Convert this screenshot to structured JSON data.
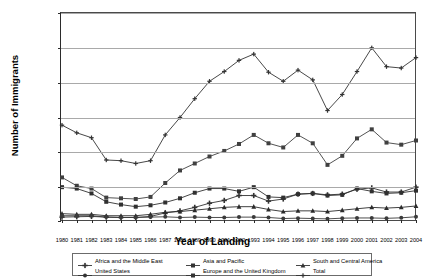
{
  "chart_data": {
    "type": "line",
    "title": "",
    "xlabel": "Year of Landing",
    "ylabel": "Number of Immigrants",
    "ylim": [
      0,
      300000
    ],
    "ytick_labels": [
      "300,000",
      "250,000",
      "200,000",
      "150,000",
      "100,000",
      "50,000",
      "0"
    ],
    "ytick_values": [
      300000,
      250000,
      200000,
      150000,
      100000,
      50000,
      0
    ],
    "grid": true,
    "legend_position": "bottom",
    "categories": [
      "1980",
      "1981",
      "1982",
      "1983",
      "1984",
      "1985",
      "1986",
      "1987",
      "1988",
      "1989",
      "1990",
      "1991",
      "1992",
      "1993",
      "1994",
      "1995",
      "1996",
      "1997",
      "1998",
      "1999",
      "2000",
      "2001",
      "2002",
      "2003",
      "2004"
    ],
    "series": [
      {
        "name": "Africa and the Middle East",
        "marker": "plus-cross",
        "color": "#333333",
        "values": [
          7000,
          7500,
          8000,
          7000,
          6500,
          6500,
          8000,
          13000,
          16000,
          21000,
          27000,
          31000,
          38000,
          38000,
          30000,
          33000,
          40000,
          41000,
          39000,
          40000,
          47000,
          49000,
          43000,
          43000,
          50000
        ]
      },
      {
        "name": "Asia and Pacific",
        "marker": "square",
        "color": "#404040",
        "values": [
          64000,
          52000,
          48000,
          35000,
          34000,
          33000,
          36000,
          56000,
          74000,
          84000,
          94000,
          102000,
          112000,
          125000,
          113000,
          107000,
          125000,
          113000,
          82000,
          95000,
          120000,
          133000,
          114000,
          111000,
          117000
        ]
      },
      {
        "name": "South and Central America",
        "marker": "triangle",
        "color": "#2b2b2b",
        "values": [
          12000,
          11000,
          11000,
          9000,
          9000,
          9000,
          11000,
          14000,
          15000,
          17000,
          19000,
          21000,
          22000,
          22000,
          18000,
          15000,
          16000,
          16000,
          15000,
          17000,
          19000,
          21000,
          20000,
          21000,
          23000
        ]
      },
      {
        "name": "United States",
        "marker": "circle",
        "color": "#3a3a3a",
        "values": [
          9000,
          9000,
          9000,
          7000,
          6500,
          6500,
          7000,
          7500,
          6500,
          7000,
          6500,
          6500,
          7000,
          7000,
          6500,
          5000,
          5500,
          5000,
          4500,
          5500,
          5800,
          5800,
          5300,
          6000,
          7500
        ]
      },
      {
        "name": "Europe and the United Kingdom",
        "marker": "filled-square",
        "color": "#303030",
        "values": [
          50000,
          48000,
          41000,
          29000,
          25000,
          22000,
          24000,
          28000,
          34000,
          42000,
          48000,
          48000,
          44000,
          50000,
          36000,
          35000,
          40000,
          41000,
          38000,
          39000,
          48000,
          44000,
          41000,
          42000,
          45000
        ]
      },
      {
        "name": "Total",
        "marker": "line-plus",
        "color": "#333333",
        "values": [
          139000,
          128000,
          121000,
          89000,
          88000,
          84000,
          88000,
          125000,
          150000,
          177000,
          202000,
          216000,
          232000,
          241000,
          215000,
          202000,
          218000,
          204000,
          160000,
          183000,
          216000,
          250000,
          223000,
          221000,
          236000
        ]
      }
    ]
  },
  "legend": {
    "items": [
      {
        "label": "Africa and the Middle East",
        "marker": "plus-cross"
      },
      {
        "label": "Asia and Pacific",
        "marker": "square"
      },
      {
        "label": "South and Central America",
        "marker": "triangle"
      },
      {
        "label": "United States",
        "marker": "circle"
      },
      {
        "label": "Europe and the United Kingdom",
        "marker": "filled-square"
      },
      {
        "label": "Total",
        "marker": "line-plus"
      }
    ]
  }
}
